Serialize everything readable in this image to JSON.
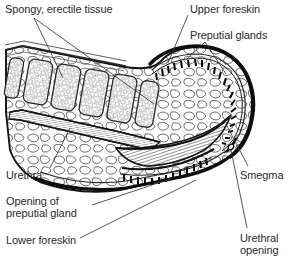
{
  "figure": {
    "type": "anatomical-line-drawing",
    "style": "black-and-white pen-and-ink line art, stippled and hatched textures",
    "background_color": "#ffffff",
    "line_color": "#1a1a1a",
    "text_color": "#2b2b2b"
  },
  "labels": {
    "spongy_tissue": "Spongy, erectile tissue",
    "upper_foreskin": "Upper foreskin",
    "preputial_glands": "Preputial glands",
    "urethra": "Urethra",
    "opening_of_preputial_gland_line1": "Opening of",
    "opening_of_preputial_gland_line2": "preputial gland",
    "lower_foreskin": "Lower foreskin",
    "smegma": "Smegma",
    "urethral_opening_line1": "Urethral",
    "urethral_opening_line2": "opening"
  },
  "structures": [
    {
      "name": "spongy-erectile-tissue",
      "description": "row of five rounded rectangular chambers filled with fine bubble/vesicle texture, upper left shaft"
    },
    {
      "name": "upper-foreskin",
      "description": "thick dark outer contour arching over the top right of the glans"
    },
    {
      "name": "preputial-glands-upper",
      "description": "curved comb-like row of short dark dashes along inner surface of upper foreskin"
    },
    {
      "name": "preputial-glands-lower",
      "description": "curved comb-like row of short dark dashes along inner surface of lower foreskin"
    },
    {
      "name": "urethra",
      "description": "narrow finely cross-hatched channel running diagonally through the lower shaft"
    },
    {
      "name": "glans-smegma-body",
      "description": "elongated densely hatched spindle shape in the centre-right cavity"
    },
    {
      "name": "lower-foreskin",
      "description": "thick dark contour sweeping along the bottom and curving up at the right tip"
    },
    {
      "name": "urethral-opening",
      "description": "small aperture at the right distal tip of the glans"
    },
    {
      "name": "connective-tissue-matrix",
      "description": "irregular rounded cell outlines filling the shaft and prepuce interior"
    }
  ],
  "caption": {
    "clipped_text": ""
  }
}
